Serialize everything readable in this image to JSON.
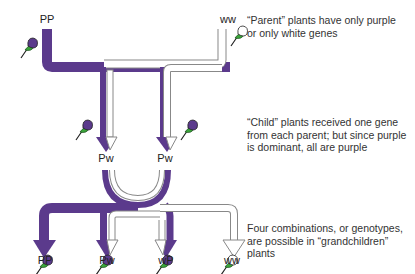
{
  "colors": {
    "dominant_purple": "#5b3a8c",
    "recessive_outline": "#888888",
    "leaf_green": "#3aa53a",
    "white_flower": "#ffffff"
  },
  "generations": {
    "parents": {
      "left": {
        "genotype": "PP",
        "flower": "purple"
      },
      "right": {
        "genotype": "ww",
        "flower": "white"
      },
      "caption": "“Parent” plants have only purple\nor only white genes"
    },
    "children": {
      "left": {
        "genotype": "Pw",
        "flower": "purple"
      },
      "right": {
        "genotype": "Pw",
        "flower": "purple"
      },
      "caption": "“Child” plants received one gene\nfrom each parent; but since purple\nis dominant, all are purple"
    },
    "grandchildren": {
      "items": [
        {
          "genotype": "PP",
          "flower": "purple"
        },
        {
          "genotype": "Pw",
          "flower": "purple"
        },
        {
          "genotype": "wP",
          "flower": "purple"
        },
        {
          "genotype": "ww",
          "flower": "white"
        }
      ],
      "caption": "Four combinations, or genotypes,\nare possible in “grandchildren”\nplants"
    }
  }
}
